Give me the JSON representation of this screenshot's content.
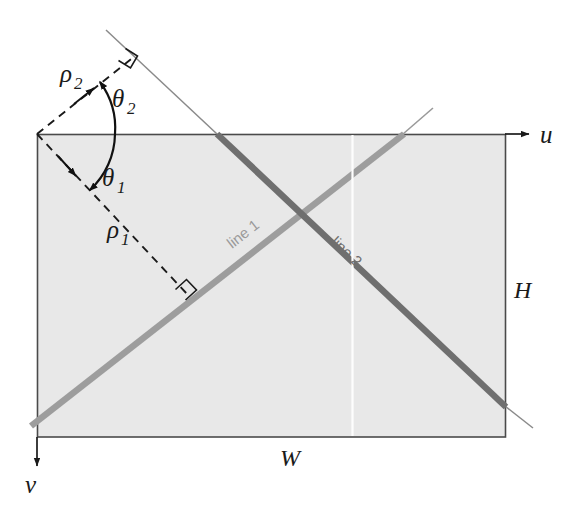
{
  "figure": {
    "canvas": {
      "width": 587,
      "height": 520
    },
    "background_color": "#ffffff"
  },
  "image_rect": {
    "name": "image-plane-rectangle",
    "x": 37,
    "y": 134,
    "width": 468,
    "height": 303,
    "fill_color": "#e8e8e8",
    "stroke_color": "#4a4a4a"
  },
  "axes": {
    "u_axis": {
      "label": "u",
      "label_x": 543,
      "label_y": 142,
      "from_x": 505,
      "from_y": 134,
      "to_x": 528,
      "to_y": 134,
      "color": "#1a1a1a"
    },
    "v_axis": {
      "label": "v",
      "label_x": 31,
      "label_y": 492,
      "from_x": 37,
      "from_y": 437,
      "to_x": 37,
      "to_y": 465,
      "color": "#1a1a1a"
    }
  },
  "dimensions": {
    "width_label": "W",
    "width_label_x": 288,
    "width_label_y": 460,
    "height_label": "H",
    "height_label_x": 521,
    "height_label_y": 291,
    "color": "#1a1a1a"
  },
  "lines": [
    {
      "id": "line1",
      "label": "line 1",
      "color": "#9a9a9a",
      "thin_extension_color": "#8e8e8e",
      "stroke_width": 6,
      "label_x": 232,
      "label_y": 249,
      "label_rotation": -33,
      "segment": {
        "x1": 31,
        "y1": 426,
        "x2": 403,
        "y2": 134
      },
      "extension": {
        "x1": 403,
        "y1": 134,
        "x2": 433,
        "y2": 108
      }
    },
    {
      "id": "line2",
      "label": "line 2",
      "color": "#6d6d6d",
      "thin_extension_color": "#757575",
      "stroke_width": 6,
      "label_x": 337,
      "label_y": 251,
      "label_rotation": 50,
      "segment": {
        "x1": 217,
        "y1": 134,
        "x2": 505,
        "y2": 406
      },
      "extension": {
        "x1": 217,
        "y1": 134,
        "x2": 106,
        "y2": 30
      },
      "extension_end": {
        "x1": 505,
        "y1": 406,
        "x2": 532,
        "y2": 428
      }
    }
  ],
  "rho_vectors": [
    {
      "id": "rho1",
      "label": "ρ₁",
      "label_text": "ρ",
      "label_sub": "1",
      "label_x": 114,
      "label_y": 232,
      "from_x": 37,
      "from_y": 134,
      "to_x": 186,
      "to_y": 293,
      "arrow_at_x": 75,
      "arrow_at_y": 175,
      "style": "dashed",
      "color": "#1a1a1a",
      "right_angle_at": {
        "x": 186,
        "y": 293
      }
    },
    {
      "id": "rho2",
      "label": "ρ₂",
      "label_text": "ρ",
      "label_sub": "2",
      "label_x": 72,
      "label_y": 76,
      "from_x": 37,
      "from_y": 134,
      "to_x": 133,
      "to_y": 58,
      "arrow_at_x": 93,
      "arrow_at_y": 89,
      "style": "dashed",
      "color": "#1a1a1a",
      "right_angle_at": {
        "x": 133,
        "y": 58
      }
    }
  ],
  "angles": [
    {
      "id": "theta1",
      "label_text": "θ",
      "label_sub": "1",
      "label_x": 110,
      "label_y": 180,
      "vertex_x": 37,
      "vertex_y": 134,
      "arc_radius": 78,
      "start_deg": 0,
      "end_deg": 47,
      "direction": "clockwise-down",
      "color": "#111111"
    },
    {
      "id": "theta2",
      "label_text": "θ",
      "label_sub": "2",
      "label_x": 120,
      "label_y": 101,
      "vertex_x": 37,
      "vertex_y": 134,
      "arc_radius": 78,
      "start_deg": 0,
      "end_deg": 38,
      "direction": "counterclockwise-up",
      "color": "#111111"
    }
  ],
  "artifacts": {
    "scan_line": {
      "name": "vertical-scan-artifact",
      "x": 352,
      "y1": 134,
      "y2": 437,
      "color": "#ffffff"
    }
  }
}
